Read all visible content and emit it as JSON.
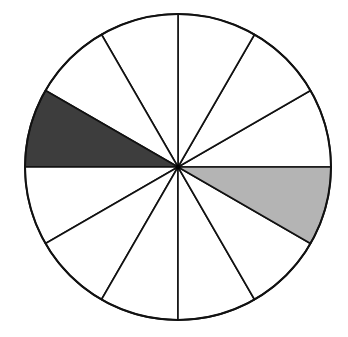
{
  "chart_data": {
    "type": "pie",
    "title": "",
    "total_sectors": 12,
    "sector_angle_deg": 30,
    "sectors": [
      {
        "index": 0,
        "start_deg": 0,
        "end_deg": 30,
        "fill": "#ffffff",
        "shaded": false
      },
      {
        "index": 1,
        "start_deg": 30,
        "end_deg": 60,
        "fill": "#ffffff",
        "shaded": false
      },
      {
        "index": 2,
        "start_deg": 60,
        "end_deg": 90,
        "fill": "#ffffff",
        "shaded": false
      },
      {
        "index": 3,
        "start_deg": 90,
        "end_deg": 120,
        "fill": "#ffffff",
        "shaded": false
      },
      {
        "index": 4,
        "start_deg": 120,
        "end_deg": 150,
        "fill": "#ffffff",
        "shaded": false
      },
      {
        "index": 5,
        "start_deg": 150,
        "end_deg": 180,
        "fill": "#3d3d3d",
        "shaded": true,
        "shade": "dark"
      },
      {
        "index": 6,
        "start_deg": 180,
        "end_deg": 210,
        "fill": "#ffffff",
        "shaded": false
      },
      {
        "index": 7,
        "start_deg": 210,
        "end_deg": 240,
        "fill": "#ffffff",
        "shaded": false
      },
      {
        "index": 8,
        "start_deg": 240,
        "end_deg": 270,
        "fill": "#ffffff",
        "shaded": false
      },
      {
        "index": 9,
        "start_deg": 270,
        "end_deg": 300,
        "fill": "#ffffff",
        "shaded": false
      },
      {
        "index": 10,
        "start_deg": 300,
        "end_deg": 330,
        "fill": "#ffffff",
        "shaded": false
      },
      {
        "index": 11,
        "start_deg": 330,
        "end_deg": 360,
        "fill": "#b4b4b4",
        "shaded": true,
        "shade": "light"
      }
    ],
    "values": [
      1,
      1,
      1,
      1,
      1,
      1,
      1,
      1,
      1,
      1,
      1,
      1
    ],
    "shaded_count": {
      "dark": 1,
      "light": 1,
      "white": 10
    },
    "legend": []
  },
  "geometry": {
    "cx": 178,
    "cy": 167,
    "r": 153,
    "stroke": "#111111",
    "stroke_width": 1.6
  }
}
